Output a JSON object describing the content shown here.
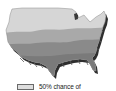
{
  "map": {
    "subject": "United States",
    "style": "3d-extruded",
    "bands": [
      {
        "name": "north-band",
        "color": "#d6d6d6"
      },
      {
        "name": "middle-band",
        "color": "#a9a9a9"
      },
      {
        "name": "south-band",
        "color": "#8a8a8a"
      }
    ],
    "extrusion_color": "#2e2e2e"
  },
  "legend": {
    "items": [
      {
        "swatch_color": "#dedede",
        "label": "50% chance of"
      }
    ]
  }
}
